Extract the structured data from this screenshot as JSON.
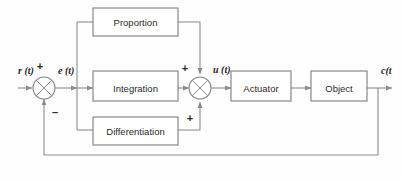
{
  "diagram": {
    "colors": {
      "background": "#fefefe",
      "line": "#8a8a8a",
      "block_border": "#7d7d7d",
      "block_fill": "#ffffff",
      "text": "#2b2b2b"
    },
    "blocks": [
      {
        "id": "proportion",
        "label": "Proportion"
      },
      {
        "id": "integration",
        "label": "Integration"
      },
      {
        "id": "differentiation",
        "label": "Differentiation"
      },
      {
        "id": "actuator",
        "label": "Actuator"
      },
      {
        "id": "object",
        "label": "Object"
      }
    ],
    "signals": [
      {
        "id": "input",
        "label": "r (t)"
      },
      {
        "id": "error",
        "label": "e (t)"
      },
      {
        "id": "control",
        "label": "u (t)"
      },
      {
        "id": "output",
        "label": "c(t"
      }
    ],
    "junctions": [
      {
        "id": "error-summer",
        "signs": [
          {
            "position": "top",
            "label": "+"
          },
          {
            "position": "bottom",
            "label": "–"
          }
        ]
      },
      {
        "id": "control-summer",
        "signs": [
          {
            "position": "left",
            "label": "+"
          },
          {
            "position": "bottom",
            "label": "+"
          }
        ]
      }
    ],
    "paths": [
      {
        "id": "reference-in",
        "from": "r(t)",
        "to": "error-summer"
      },
      {
        "id": "error-out",
        "from": "error-summer",
        "to": "split-node"
      },
      {
        "id": "split-to-proportion",
        "from": "split-node",
        "to": "proportion"
      },
      {
        "id": "split-to-integration",
        "from": "split-node",
        "to": "integration"
      },
      {
        "id": "split-to-differentiation",
        "from": "split-node",
        "to": "differentiation"
      },
      {
        "id": "proportion-to-summer",
        "from": "proportion",
        "to": "control-summer"
      },
      {
        "id": "integration-to-summer",
        "from": "integration",
        "to": "control-summer"
      },
      {
        "id": "differentiation-to-summer",
        "from": "differentiation",
        "to": "control-summer"
      },
      {
        "id": "summer-to-actuator",
        "from": "control-summer",
        "to": "actuator"
      },
      {
        "id": "actuator-to-object",
        "from": "actuator",
        "to": "object"
      },
      {
        "id": "object-to-output",
        "from": "object",
        "to": "c(t)"
      },
      {
        "id": "feedback",
        "from": "output-tap",
        "to": "error-summer"
      }
    ]
  }
}
